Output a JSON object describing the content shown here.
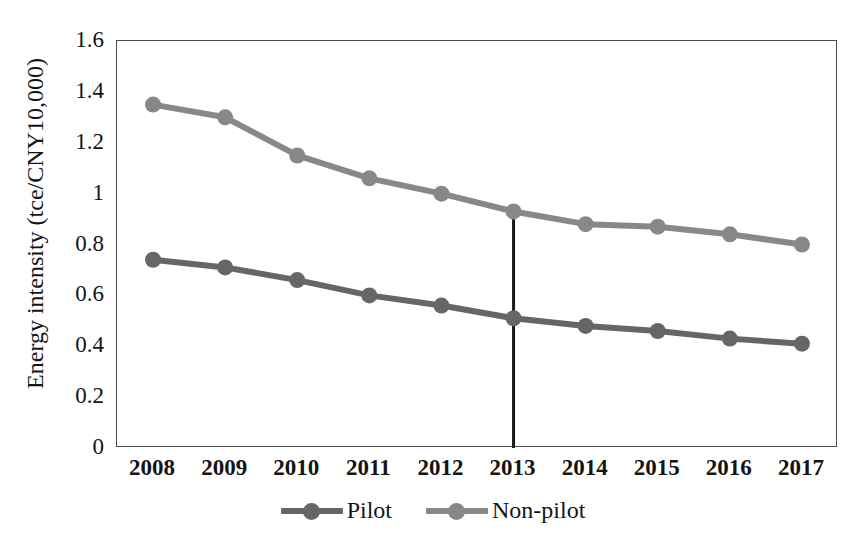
{
  "chart_data": {
    "type": "line",
    "title": "",
    "xlabel": "",
    "ylabel": "Energy intensity (tce/CNY10,000)",
    "categories": [
      "2008",
      "2009",
      "2010",
      "2011",
      "2012",
      "2013",
      "2014",
      "2015",
      "2016",
      "2017"
    ],
    "ylim": [
      0,
      1.6
    ],
    "yticks": [
      "0",
      "0.2",
      "0.4",
      "0.6",
      "0.8",
      "1",
      "1.2",
      "1.4",
      "1.6"
    ],
    "ytick_values": [
      0,
      0.2,
      0.4,
      0.6,
      0.8,
      1,
      1.2,
      1.4,
      1.6
    ],
    "grid": false,
    "legend_position": "bottom",
    "series": [
      {
        "name": "Pilot",
        "color": "#666666",
        "values": [
          0.74,
          0.71,
          0.66,
          0.6,
          0.56,
          0.51,
          0.48,
          0.46,
          0.43,
          0.41
        ]
      },
      {
        "name": "Non-pilot",
        "color": "#888888",
        "values": [
          1.35,
          1.3,
          1.15,
          1.06,
          1.0,
          0.93,
          0.88,
          0.87,
          0.84,
          0.8
        ]
      }
    ],
    "annotations": [
      {
        "type": "vertical-line",
        "at_category": "2013",
        "label": "",
        "color": "#1a1a1a",
        "from_value": 0,
        "to_value": 0.93
      }
    ]
  },
  "axis": {
    "frame_color": "#4d4d4d"
  }
}
